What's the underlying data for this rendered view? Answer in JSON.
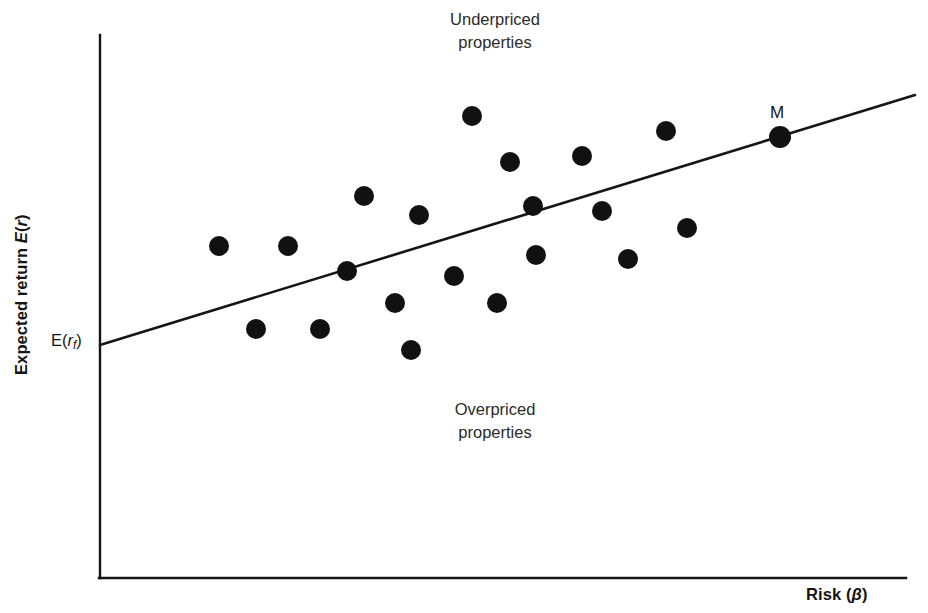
{
  "figure": {
    "background_color": "#ffffff",
    "ink_color": "#151515"
  },
  "axes": {
    "y_label_text": "Expected return E(r)",
    "y_label_plain": "Expected return E(r)",
    "x_label_text": "Risk (β)",
    "x_label_plain": "Risk (beta)",
    "origin_x": 100,
    "origin_y": 578,
    "y_axis_top": 35,
    "x_axis_right": 906
  },
  "annotations": {
    "upper_region": "Underpriced\nproperties",
    "upper_region_line1": "Underpriced",
    "upper_region_line2": "properties",
    "lower_region": "Overpriced\nproperties",
    "lower_region_line1": "Overpriced",
    "lower_region_line2": "properties",
    "intercept_label": "E(r_f)",
    "intercept_label_plain": "E(rf)",
    "market_point_label": "M"
  },
  "chart_data": {
    "type": "scatter",
    "title": "",
    "subtitle": "",
    "xlabel": "Risk (β)",
    "ylabel": "Expected return E(r)",
    "grid": false,
    "legend": null,
    "axis_ticks": {
      "x": [],
      "y": [
        "E(r_f)"
      ]
    },
    "xlim": [
      100,
      906
    ],
    "ylim": [
      578,
      35
    ],
    "note": "Security Market Line (SML) with scattered asset points; coordinates are in screenshot pixel space, y grows downward.",
    "series": [
      {
        "name": "Security market line (SML)",
        "type": "line",
        "stroke": "#151515",
        "stroke_width": 2.6,
        "points": [
          {
            "x": 100,
            "y": 345
          },
          {
            "x": 915,
            "y": 95
          }
        ]
      },
      {
        "name": "Market portfolio M",
        "type": "scatter",
        "marker": "filled-circle",
        "radius": 11,
        "fill": "#111111",
        "points": [
          {
            "x": 780,
            "y": 137,
            "label": "M"
          }
        ]
      },
      {
        "name": "Individual properties",
        "type": "scatter",
        "marker": "filled-circle",
        "radius": 10,
        "fill": "#111111",
        "points": [
          {
            "x": 219,
            "y": 246
          },
          {
            "x": 288,
            "y": 246
          },
          {
            "x": 347,
            "y": 271
          },
          {
            "x": 256,
            "y": 329
          },
          {
            "x": 320,
            "y": 329
          },
          {
            "x": 364,
            "y": 196
          },
          {
            "x": 419,
            "y": 215
          },
          {
            "x": 472,
            "y": 116
          },
          {
            "x": 510,
            "y": 162
          },
          {
            "x": 454,
            "y": 276
          },
          {
            "x": 395,
            "y": 303
          },
          {
            "x": 411,
            "y": 350
          },
          {
            "x": 497,
            "y": 303
          },
          {
            "x": 533,
            "y": 206
          },
          {
            "x": 536,
            "y": 255
          },
          {
            "x": 582,
            "y": 156
          },
          {
            "x": 602,
            "y": 211
          },
          {
            "x": 628,
            "y": 259
          },
          {
            "x": 666,
            "y": 131
          },
          {
            "x": 687,
            "y": 228
          }
        ]
      }
    ]
  }
}
